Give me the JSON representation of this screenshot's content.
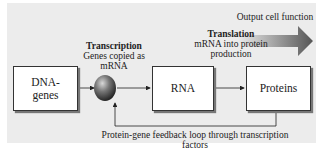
{
  "diagram": {
    "output_label": "Output cell function",
    "transcription": {
      "title": "Transcription",
      "desc_line1": "Genes copied as",
      "desc_line2": "mRNA"
    },
    "translation": {
      "title": "Translation",
      "desc_line1": "mRNA into protein",
      "desc_line2": "production"
    },
    "nodes": [
      {
        "id": "dna",
        "line1": "DNA-",
        "line2": "genes"
      },
      {
        "id": "rna",
        "line1": "RNA"
      },
      {
        "id": "proteins",
        "line1": "Proteins"
      }
    ],
    "feedback_label": "Protein-gene feedback loop through transcription factors",
    "colors": {
      "panel": "#ececec",
      "sphere": "#555555",
      "arrow": "#666666"
    }
  }
}
